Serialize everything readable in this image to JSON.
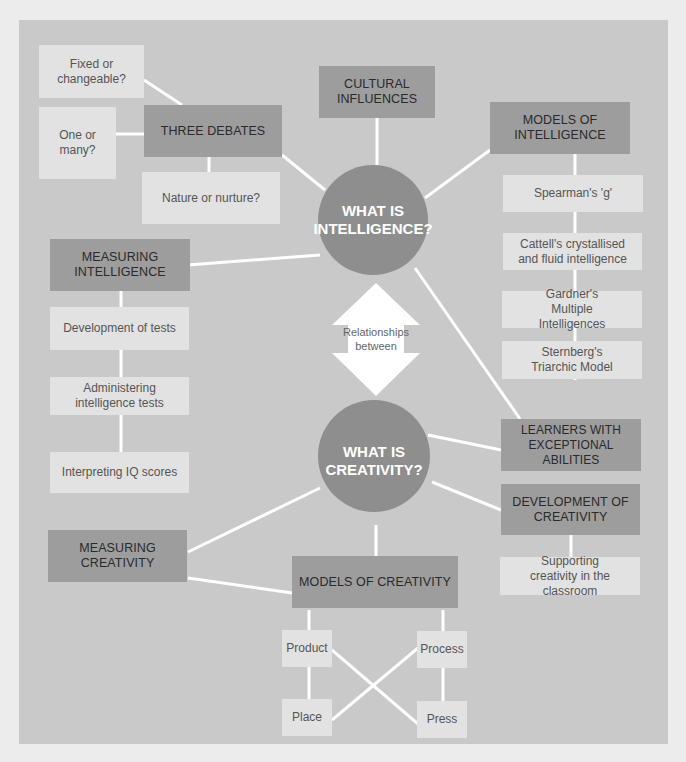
{
  "diagram": {
    "colors": {
      "background": "#ececec",
      "panel": "#c9c9c9",
      "dark_box": "#9d9d9d",
      "light_box": "#e2e2e2",
      "circle": "#8e8e8e",
      "connector": "#ffffff"
    },
    "hubs": {
      "intelligence": "WHAT IS INTELLIGENCE?",
      "intelligence_l1": "WHAT IS",
      "intelligence_l2": "INTELLIGENCE?",
      "creativity_l1": "WHAT IS",
      "creativity_l2": "CREATIVITY?"
    },
    "relationship_arrow": {
      "line1": "Relationships",
      "line2": "between"
    },
    "intelligence_topics": {
      "three_debates": {
        "label": "THREE DEBATES",
        "children": [
          "Fixed or changeable?",
          "One or many?",
          "Nature or nurture?"
        ]
      },
      "cultural_influences": {
        "label_l1": "CULTURAL",
        "label_l2": "INFLUENCES"
      },
      "models_of_intelligence": {
        "label_l1": "MODELS OF",
        "label_l2": "INTELLIGENCE",
        "children": [
          "Spearman's 'g'",
          "Cattell's crystallised and fluid intelligence",
          "Gardner's Multiple Intelligences",
          "Sternberg's Triarchic Model"
        ]
      },
      "measuring_intelligence": {
        "label_l1": "MEASURING",
        "label_l2": "INTELLIGENCE",
        "children": [
          "Development of tests",
          "Administering intelligence tests",
          "Interpreting IQ scores"
        ]
      }
    },
    "shared": {
      "learners_l1": "LEARNERS WITH",
      "learners_l2": "EXCEPTIONAL ABILITIES"
    },
    "creativity_topics": {
      "development_of_creativity": {
        "label_l1": "DEVELOPMENT OF",
        "label_l2": "CREATIVITY",
        "children": [
          "Supporting creativity in the classroom"
        ]
      },
      "measuring_creativity": {
        "label_l1": "MEASURING",
        "label_l2": "CREATIVITY"
      },
      "models_of_creativity": {
        "label": "MODELS OF CREATIVITY",
        "children": [
          "Product",
          "Process",
          "Place",
          "Press"
        ]
      }
    }
  }
}
